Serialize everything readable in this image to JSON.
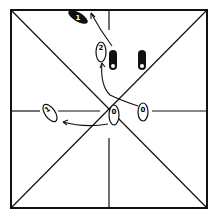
{
  "diagram": {
    "type": "dance-step-floor-diagram",
    "colors": {
      "line": "#111111",
      "background": "#ffffff",
      "filled_foot": "#111111"
    },
    "footprints": [
      {
        "id": "start-right",
        "label": "0",
        "style": "outline",
        "x": 143,
        "y": 113
      },
      {
        "id": "start-center",
        "label": "0",
        "style": "outline",
        "x": 114,
        "y": 116
      },
      {
        "id": "step-1-left",
        "label": "1",
        "style": "outline",
        "x": 48,
        "y": 113
      },
      {
        "id": "step-2",
        "label": "2",
        "style": "outline",
        "x": 101,
        "y": 52
      },
      {
        "id": "end-1-dark",
        "label": "1",
        "style": "filled",
        "x": 77,
        "y": 17
      },
      {
        "id": "dark-a",
        "label": "0",
        "style": "filled",
        "x": 113,
        "y": 60
      },
      {
        "id": "dark-b",
        "label": "0",
        "style": "filled",
        "x": 142,
        "y": 60
      }
    ]
  }
}
